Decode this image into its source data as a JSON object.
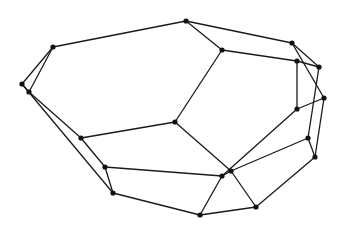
{
  "diagram": {
    "type": "graph",
    "width": 340,
    "height": 234,
    "edge_color": "#1a1a1a",
    "node_color": "#111111",
    "node_radius": 2.6,
    "nodes": [
      {
        "id": "A",
        "x": 53,
        "y": 47
      },
      {
        "id": "B",
        "x": 22,
        "y": 84
      },
      {
        "id": "C",
        "x": 29,
        "y": 92
      },
      {
        "id": "D",
        "x": 186,
        "y": 21
      },
      {
        "id": "E",
        "x": 222,
        "y": 50
      },
      {
        "id": "F",
        "x": 292,
        "y": 43
      },
      {
        "id": "G",
        "x": 297,
        "y": 61
      },
      {
        "id": "H",
        "x": 319,
        "y": 67
      },
      {
        "id": "I",
        "x": 324,
        "y": 98
      },
      {
        "id": "J",
        "x": 297,
        "y": 109
      },
      {
        "id": "K",
        "x": 175,
        "y": 122
      },
      {
        "id": "L",
        "x": 81,
        "y": 138
      },
      {
        "id": "M",
        "x": 105,
        "y": 167
      },
      {
        "id": "N",
        "x": 113,
        "y": 193
      },
      {
        "id": "O",
        "x": 308,
        "y": 138
      },
      {
        "id": "P",
        "x": 315,
        "y": 157
      },
      {
        "id": "Q",
        "x": 231,
        "y": 171
      },
      {
        "id": "R",
        "x": 222,
        "y": 176
      },
      {
        "id": "S",
        "x": 256,
        "y": 207
      },
      {
        "id": "T",
        "x": 200,
        "y": 215
      }
    ],
    "edges": [
      [
        "A",
        "D"
      ],
      [
        "A",
        "B"
      ],
      [
        "A",
        "C"
      ],
      [
        "B",
        "C"
      ],
      [
        "C",
        "L"
      ],
      [
        "B",
        "N"
      ],
      [
        "D",
        "E"
      ],
      [
        "D",
        "F"
      ],
      [
        "E",
        "G"
      ],
      [
        "E",
        "K"
      ],
      [
        "F",
        "H"
      ],
      [
        "F",
        "I"
      ],
      [
        "G",
        "H"
      ],
      [
        "G",
        "J"
      ],
      [
        "H",
        "O"
      ],
      [
        "I",
        "J"
      ],
      [
        "I",
        "P"
      ],
      [
        "O",
        "P"
      ],
      [
        "O",
        "Q"
      ],
      [
        "P",
        "S"
      ],
      [
        "K",
        "L"
      ],
      [
        "K",
        "Q"
      ],
      [
        "Q",
        "S"
      ],
      [
        "Q",
        "R"
      ],
      [
        "J",
        "R"
      ],
      [
        "L",
        "M"
      ],
      [
        "M",
        "N"
      ],
      [
        "M",
        "R"
      ],
      [
        "R",
        "T"
      ],
      [
        "N",
        "T"
      ],
      [
        "T",
        "S"
      ]
    ]
  }
}
